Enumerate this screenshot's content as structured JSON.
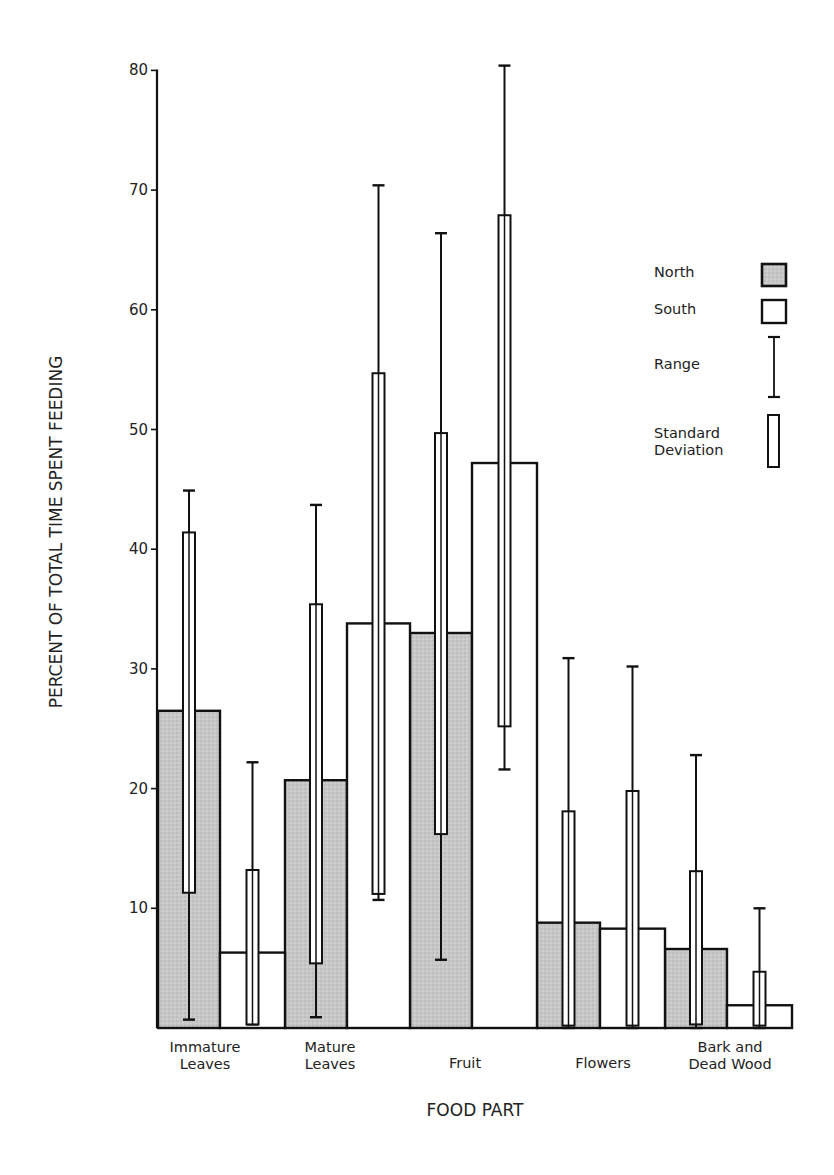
{
  "chart_data": {
    "type": "bar",
    "title": "",
    "xlabel": "FOOD PART",
    "ylabel": "PERCENT OF TOTAL TIME SPENT FEEDING",
    "ylim": [
      0,
      80
    ],
    "yticks": [
      10,
      20,
      30,
      40,
      50,
      60,
      70,
      80
    ],
    "grid": false,
    "legend_position": "upper right",
    "categories": [
      [
        "Immature",
        "Leaves"
      ],
      [
        "Mature",
        "Leaves"
      ],
      [
        "Fruit"
      ],
      [
        "Flowers"
      ],
      [
        "Bark and",
        "Dead Wood"
      ]
    ],
    "series": [
      {
        "name": "North",
        "fill": "#c4c4c4",
        "values": [
          26.5,
          20.7,
          33.0,
          8.8,
          6.6
        ],
        "sd_low": [
          11.3,
          5.4,
          16.2,
          0.2,
          0.3
        ],
        "sd_high": [
          41.4,
          35.4,
          49.7,
          18.1,
          13.1
        ],
        "range_low": [
          0.7,
          0.9,
          5.7,
          0.0,
          0.0
        ],
        "range_high": [
          44.9,
          43.7,
          66.4,
          30.9,
          22.8
        ]
      },
      {
        "name": "South",
        "fill": "#ffffff",
        "values": [
          6.3,
          33.8,
          47.2,
          8.3,
          1.9
        ],
        "sd_low": [
          0.3,
          11.2,
          25.2,
          0.2,
          0.2
        ],
        "sd_high": [
          13.2,
          54.7,
          67.9,
          19.8,
          4.7
        ],
        "range_low": [
          0.3,
          10.7,
          21.6,
          0.0,
          0.0
        ],
        "range_high": [
          22.2,
          70.4,
          80.4,
          30.2,
          10.0
        ]
      }
    ],
    "legend": [
      {
        "label": "North",
        "symbol": "shaded-box"
      },
      {
        "label": "South",
        "symbol": "open-box"
      },
      {
        "label": "Range",
        "symbol": "i-beam"
      },
      {
        "label": [
          "Standard",
          "Deviation"
        ],
        "symbol": "narrow-open-bar"
      }
    ]
  }
}
